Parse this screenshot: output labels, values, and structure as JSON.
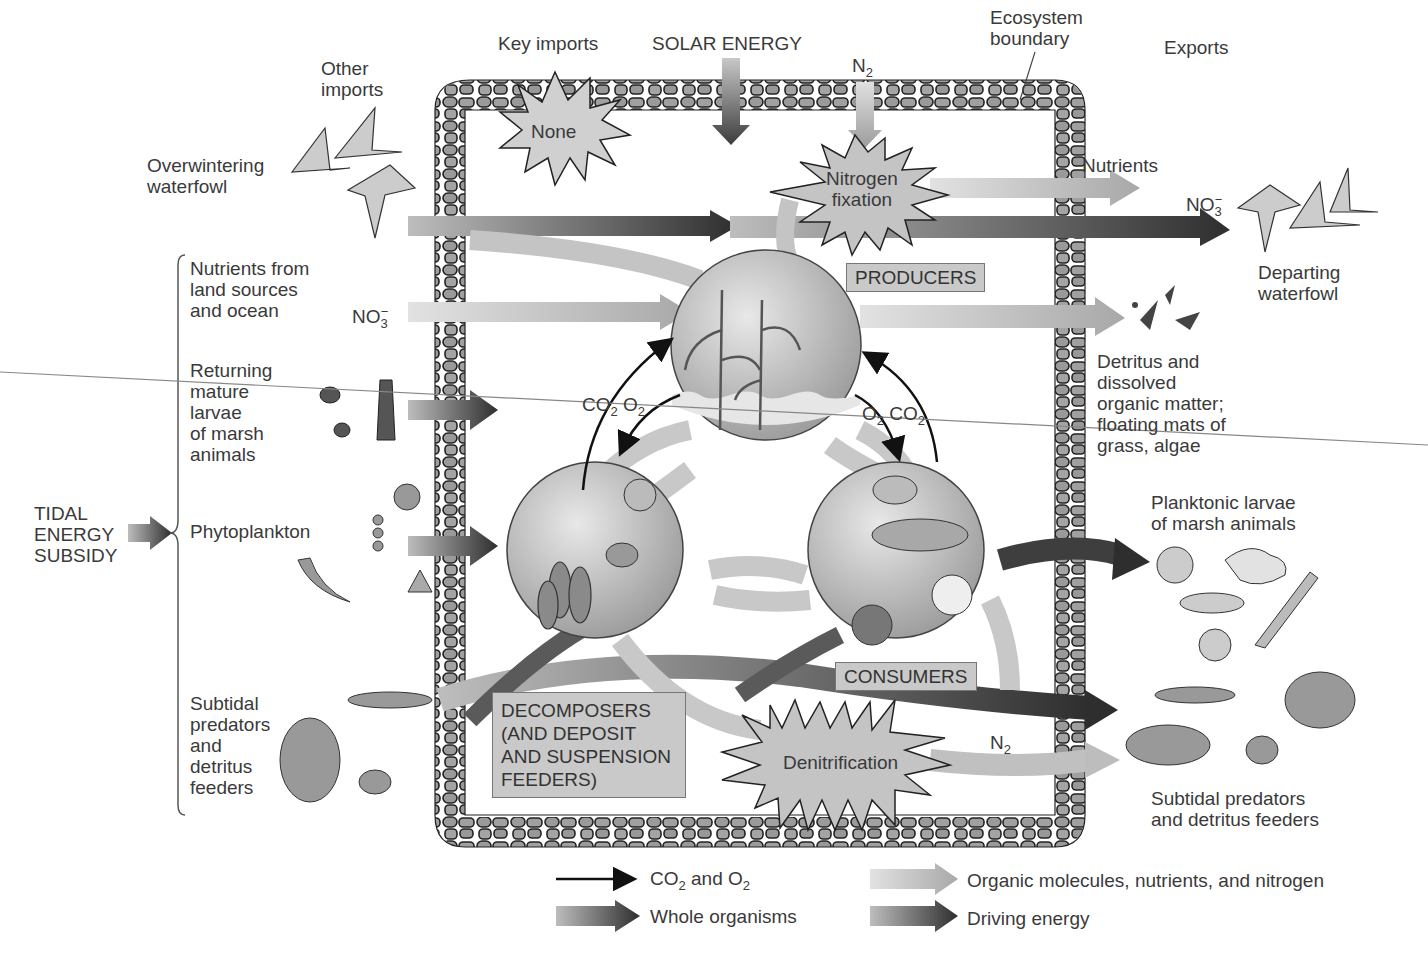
{
  "header": {
    "key_imports": "Key imports",
    "solar_energy": "SOLAR ENERGY",
    "n2_top": "N",
    "n2_top_sub": "2",
    "ecosystem_boundary": [
      "Ecosystem",
      "boundary"
    ],
    "exports": "Exports",
    "other_imports": [
      "Other",
      "imports"
    ]
  },
  "bursts": {
    "none": "None",
    "nitrogen_fixation": [
      "Nitrogen",
      "fixation"
    ],
    "denitrification": "Denitrification"
  },
  "boxes": {
    "producers": "PRODUCERS",
    "consumers": "CONSUMERS",
    "decomposers": [
      "DECOMPOSERS",
      "(AND DEPOSIT",
      "AND SUSPENSION",
      "FEEDERS)"
    ]
  },
  "imports": {
    "overwintering_waterfowl": [
      "Overwintering",
      "waterfowl"
    ],
    "nutrients_land_ocean": [
      "Nutrients from",
      "land sources",
      "and ocean"
    ],
    "no3_in": "NO",
    "no3_in_sub": "3",
    "no3_in_sup": "−",
    "returning_larvae": [
      "Returning",
      "mature",
      "larvae",
      "of marsh",
      "animals"
    ],
    "phytoplankton": "Phytoplankton",
    "subtidal_in": [
      "Subtidal",
      "predators",
      "and",
      "detritus",
      "feeders"
    ],
    "tidal_energy": [
      "TIDAL",
      "ENERGY",
      "SUBSIDY"
    ]
  },
  "exports_side": {
    "nutrients": "Nutrients",
    "no3_out": "NO",
    "no3_out_sub": "3",
    "no3_out_sup": "−",
    "departing_waterfowl": [
      "Departing",
      "waterfowl"
    ],
    "detritus": [
      "Detritus and",
      "dissolved",
      "organic matter;",
      "floating mats of",
      "grass, algae"
    ],
    "planktonic_larvae": [
      "Planktonic larvae",
      "of marsh animals"
    ],
    "n2_out": "N",
    "n2_out_sub": "2",
    "subtidal_out": [
      "Subtidal predators",
      "and detritus feeders"
    ]
  },
  "gas_labels": {
    "left": {
      "co2": "CO",
      "co2_sub": "2",
      "o2": "O",
      "o2_sub": "2"
    },
    "right": {
      "o2": "O",
      "o2_sub": "2",
      "co2": "CO",
      "co2_sub": "2"
    }
  },
  "legend": [
    {
      "key": "co2-o2",
      "label": "CO",
      "sub": "2",
      "rest": " and O",
      "sub2": "2"
    },
    {
      "key": "organic",
      "label": "Organic molecules, nutrients, and nitrogen"
    },
    {
      "key": "whole-organisms",
      "label": "Whole organisms"
    },
    {
      "key": "driving-energy",
      "label": "Driving energy"
    }
  ],
  "colors": {
    "arrow_light": "#b8b8b8",
    "arrow_dark": "#3a3a3a",
    "stone_fill": "#9a9a9a",
    "box_fill": "#c9c9c9",
    "burst_fill": "#c4c4c4"
  }
}
